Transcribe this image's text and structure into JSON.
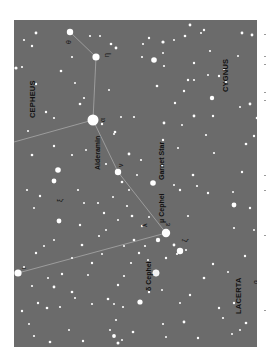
{
  "map": {
    "background": "#6b6b6b",
    "line_color": "#a8a8a8",
    "star_color": "#ffffff",
    "constellations": [
      {
        "name": "CEPHEUS",
        "x": 29,
        "y": 110
      },
      {
        "name": "CYGNUS",
        "x": 226,
        "y": 85
      },
      {
        "name": "LACERTA",
        "x": 237,
        "y": 297
      }
    ],
    "named_stars": [
      {
        "name": "Alderamin",
        "x": 96,
        "y": 160
      },
      {
        "name": "Garnet Star",
        "x": 159,
        "y": 169
      },
      {
        "name": "μ Cephei",
        "x": 159,
        "y": 208
      },
      {
        "name": "δ Cephei",
        "x": 148,
        "y": 276
      }
    ],
    "greek_labels": [
      {
        "name": "θ",
        "x": 66,
        "y": 42
      },
      {
        "name": "η",
        "x": 104,
        "y": 54
      },
      {
        "name": "α",
        "x": 100,
        "y": 120
      },
      {
        "name": "ν",
        "x": 118,
        "y": 165
      },
      {
        "name": "ξ",
        "x": 64,
        "y": 198
      },
      {
        "name": "λ",
        "x": 140,
        "y": 222
      },
      {
        "name": "ζ",
        "x": 189,
        "y": 239
      },
      {
        "name": "ε",
        "x": 166,
        "y": 222
      },
      {
        "name": "ι",
        "x": 22,
        "y": 267
      },
      {
        "name": "β",
        "x": 255,
        "y": 281
      }
    ]
  }
}
